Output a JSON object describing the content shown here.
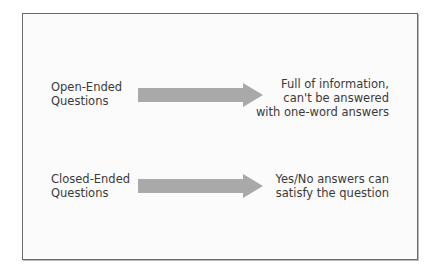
{
  "diagram": {
    "rows": [
      {
        "source": [
          "Open-Ended",
          "Questions"
        ],
        "target": [
          "Full of information,",
          "can't be answered",
          "with one-word answers"
        ]
      },
      {
        "source": [
          "Closed-Ended",
          "Questions"
        ],
        "target": [
          "Yes/No answers can",
          "satisfy the question"
        ]
      }
    ],
    "colors": {
      "arrow": "#a9a9a9",
      "border": "#6a6a6a",
      "text": "#3a3a3a"
    }
  }
}
